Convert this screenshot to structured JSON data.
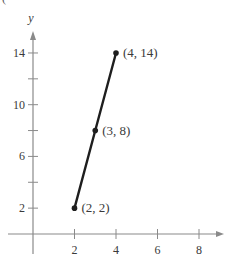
{
  "panel_label": "(",
  "chart_data": {
    "type": "line",
    "title": "",
    "xlabel": "",
    "ylabel": "y",
    "xlim": [
      -1.4,
      9.3
    ],
    "ylim": [
      -2,
      17
    ],
    "grid": false,
    "legend": null,
    "x_ticks": [
      2,
      4,
      6,
      8
    ],
    "x_tick_labels": [
      "2",
      "4",
      "6",
      "8"
    ],
    "y_ticks": [
      2,
      4,
      6,
      8,
      10,
      12,
      14
    ],
    "y_tick_labels": [
      "2",
      "",
      "6",
      "",
      "10",
      "",
      "14"
    ],
    "series": [
      {
        "name": "segment",
        "x": [
          2,
          3,
          4
        ],
        "y": [
          2,
          8,
          14
        ],
        "color": "#1e1e1e"
      }
    ],
    "annotations": [
      {
        "text": "(2, 2)",
        "x": 2,
        "y": 2
      },
      {
        "text": "(3, 8)",
        "x": 3,
        "y": 8
      },
      {
        "text": "(4, 14)",
        "x": 4,
        "y": 14
      }
    ],
    "colors": {
      "axis": "#8a8a8a",
      "line": "#1e1e1e",
      "text": "#3a3a3a"
    }
  }
}
